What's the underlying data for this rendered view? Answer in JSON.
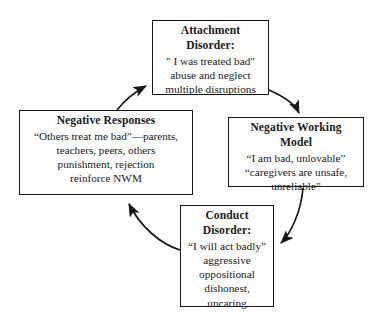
{
  "diagram": {
    "type": "cycle",
    "background_color": "#ffffff",
    "line_color": "#161616",
    "text_color": "#1a1a1a",
    "nodes": [
      {
        "id": "attachment-disorder",
        "title": "Attachment Disorder:",
        "lines": [
          "\" I was treated bad\"",
          "abuse and neglect",
          "multiple disruptions"
        ]
      },
      {
        "id": "negative-working-model",
        "title": "Negative Working Model",
        "lines": [
          "“I am bad, unlovable”",
          "“caregivers are unsafe,",
          "unreliable”"
        ]
      },
      {
        "id": "conduct-disorder",
        "title": "Conduct Disorder:",
        "lines": [
          "“I will act badly”",
          "aggressive",
          "oppositional",
          "dishonest,",
          "uncaring"
        ]
      },
      {
        "id": "negative-responses",
        "title": "Negative Responses",
        "lines": [
          "“Others treat me bad”—parents,",
          "teachers, peers, others",
          "punishment, rejection",
          "reinforce NWM"
        ]
      }
    ],
    "edges": [
      {
        "id": "edge-attachment-to-nwm",
        "from": "attachment-disorder",
        "to": "negative-working-model"
      },
      {
        "id": "edge-nwm-to-conduct",
        "from": "negative-working-model",
        "to": "conduct-disorder"
      },
      {
        "id": "edge-conduct-to-responses",
        "from": "conduct-disorder",
        "to": "negative-responses"
      },
      {
        "id": "edge-responses-to-attachment",
        "from": "negative-responses",
        "to": "attachment-disorder"
      }
    ]
  }
}
